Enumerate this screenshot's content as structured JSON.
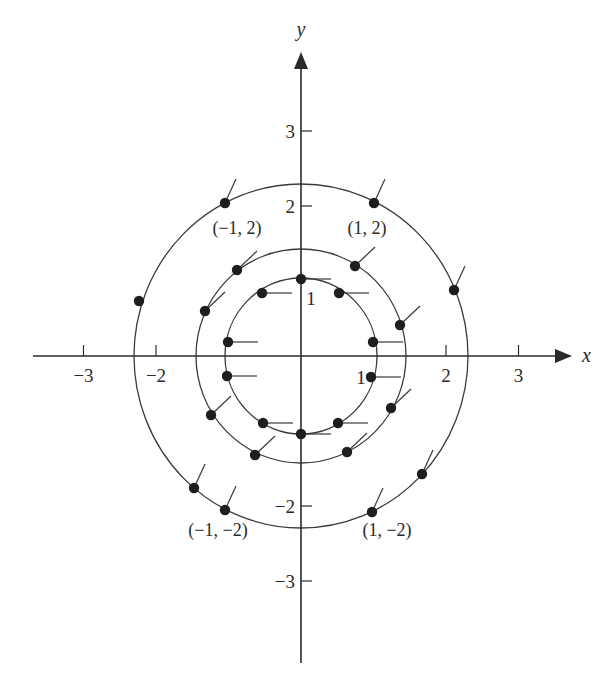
{
  "figure": {
    "type": "direction-field-with-level-curves",
    "origin_px": [
      301,
      356
    ],
    "scale_px": [
      72.5,
      75
    ],
    "axes": {
      "x": {
        "label": "x",
        "from_px": 33,
        "to_px": 572,
        "label_pos": [
          582,
          362
        ]
      },
      "y": {
        "label": "y",
        "from_px": 663,
        "to_px": 52,
        "label_pos": [
          301,
          36
        ]
      }
    },
    "x_ticks": [
      {
        "value": -3,
        "label": "−3"
      },
      {
        "value": -2,
        "label": "−2"
      },
      {
        "value": 2,
        "label": "2"
      },
      {
        "value": 3,
        "label": "3"
      }
    ],
    "y_ticks": [
      {
        "value": 3,
        "label": "3"
      },
      {
        "value": 2,
        "label": "2"
      },
      {
        "value": -2,
        "label": "−2"
      },
      {
        "value": -3,
        "label": "−3"
      }
    ],
    "unit_labels": [
      {
        "text": "1",
        "pos": [
          311,
          305
        ]
      },
      {
        "text": "1",
        "pos": [
          361,
          384
        ]
      }
    ],
    "level_curves": [
      {
        "name": "inner",
        "rx": 76,
        "ry": 78,
        "segment_dx": 30,
        "segment_dy": 0
      },
      {
        "name": "middle",
        "rx": 105,
        "ry": 107,
        "segment_dx": 20,
        "segment_dy": -19
      },
      {
        "name": "outer",
        "rx": 167,
        "ry": 172,
        "segment_dx": 11,
        "segment_dy": -24
      }
    ],
    "points": [
      {
        "curve": 0,
        "px": [
          301,
          279
        ]
      },
      {
        "curve": 0,
        "px": [
          262,
          293
        ]
      },
      {
        "curve": 0,
        "px": [
          339,
          293
        ]
      },
      {
        "curve": 0,
        "px": [
          228,
          342
        ]
      },
      {
        "curve": 0,
        "px": [
          373,
          342
        ]
      },
      {
        "curve": 0,
        "px": [
          227,
          376
        ]
      },
      {
        "curve": 0,
        "px": [
          371,
          377
        ]
      },
      {
        "curve": 0,
        "px": [
          263,
          423
        ]
      },
      {
        "curve": 0,
        "px": [
          338,
          423
        ]
      },
      {
        "curve": 0,
        "px": [
          301,
          434
        ]
      },
      {
        "curve": 1,
        "px": [
          237,
          270
        ]
      },
      {
        "curve": 1,
        "px": [
          355,
          266
        ]
      },
      {
        "curve": 1,
        "px": [
          205,
          311
        ]
      },
      {
        "curve": 1,
        "px": [
          400,
          325
        ]
      },
      {
        "curve": 1,
        "px": [
          211,
          415
        ]
      },
      {
        "curve": 1,
        "px": [
          391,
          408
        ]
      },
      {
        "curve": 1,
        "px": [
          255,
          455
        ]
      },
      {
        "curve": 1,
        "px": [
          347,
          452
        ]
      },
      {
        "curve": 2,
        "px": [
          225,
          203
        ]
      },
      {
        "curve": 2,
        "px": [
          374,
          203
        ]
      },
      {
        "curve": 2,
        "px": [
          139,
          301
        ],
        "no_segment": true
      },
      {
        "curve": 2,
        "px": [
          454,
          290
        ]
      },
      {
        "curve": 2,
        "px": [
          194,
          488
        ]
      },
      {
        "curve": 2,
        "px": [
          225,
          510
        ]
      },
      {
        "curve": 2,
        "px": [
          372,
          512
        ]
      },
      {
        "curve": 2,
        "px": [
          422,
          474
        ]
      }
    ],
    "point_labels": [
      {
        "text": "(−1, 2)",
        "pos": [
          237,
          234
        ]
      },
      {
        "text": "(1, 2)",
        "pos": [
          367,
          234
        ]
      },
      {
        "text": "(−1, −2)",
        "pos": [
          218,
          536
        ]
      },
      {
        "text": "(1, −2)",
        "pos": [
          387,
          536
        ]
      }
    ]
  }
}
